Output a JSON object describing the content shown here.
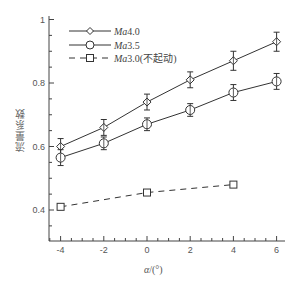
{
  "chart_data": {
    "type": "line",
    "title": "",
    "xlabel": "α/(°)",
    "ylabel": "流量系数",
    "xlim": [
      -4.5,
      6.4
    ],
    "ylim": [
      0.3,
      1.0
    ],
    "xticks": [
      -4,
      -2,
      0,
      2,
      4,
      6
    ],
    "yticks": [
      0.4,
      0.6,
      0.8,
      1
    ],
    "xtick_labels": [
      "-4",
      "-2",
      "0",
      "2",
      "4",
      "6"
    ],
    "ytick_labels": [
      "0.4",
      "0.6",
      "0.8",
      "1"
    ],
    "grid": false,
    "legend_position": "upper left",
    "series": [
      {
        "name": "Ma4.0",
        "legend_label": "Ma4.0",
        "marker": "diamond",
        "line_style": "solid",
        "error_bars": true,
        "x": [
          -4,
          -2,
          0,
          2,
          4,
          6
        ],
        "values": [
          0.6,
          0.66,
          0.74,
          0.81,
          0.87,
          0.93
        ],
        "errors": [
          0.025,
          0.025,
          0.025,
          0.025,
          0.03,
          0.03
        ]
      },
      {
        "name": "Ma3.5",
        "legend_label": "Ma3.5",
        "marker": "circle",
        "line_style": "solid",
        "error_bars": true,
        "x": [
          -4,
          -2,
          0,
          2,
          4,
          6
        ],
        "values": [
          0.565,
          0.61,
          0.67,
          0.715,
          0.77,
          0.805
        ],
        "errors": [
          0.025,
          0.02,
          0.02,
          0.02,
          0.025,
          0.025
        ]
      },
      {
        "name": "Ma3.0(不起动)",
        "legend_label": "Ma3.0(不起动)",
        "marker": "square",
        "line_style": "dashed",
        "error_bars": false,
        "x": [
          -4,
          0,
          4
        ],
        "values": [
          0.41,
          0.455,
          0.48
        ]
      }
    ]
  },
  "legend": {
    "items": [
      {
        "label_italic": "Ma",
        "label_rest": "4.0"
      },
      {
        "label_italic": "Ma",
        "label_rest": "3.5"
      },
      {
        "label_italic": "Ma",
        "label_rest": "3.0(不起动)"
      }
    ]
  },
  "axes": {
    "ylabel": "流量系数",
    "xlabel_symbol": "α",
    "xlabel_unit": "/(°)"
  },
  "colors": {
    "line": "#333333",
    "axis": "#444444",
    "text": "#555555"
  }
}
